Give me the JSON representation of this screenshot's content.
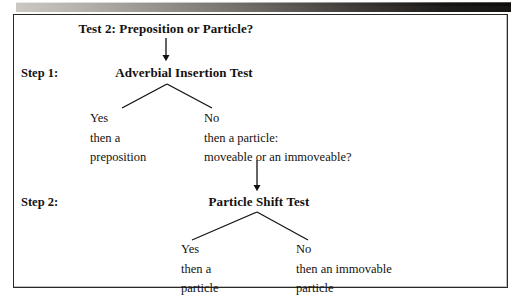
{
  "figure": {
    "title": "Test 2: Preposition or Particle?",
    "steps": [
      {
        "label": "Step 1:",
        "node": "Adverbial Insertion Test",
        "branches": [
          {
            "answer": "Yes",
            "line2": "then a",
            "line3": "preposition"
          },
          {
            "answer": "No",
            "line2": "then a particle:",
            "line3": "moveable or an immoveable?"
          }
        ]
      },
      {
        "label": "Step 2:",
        "node": "Particle Shift Test",
        "branches": [
          {
            "answer": "Yes",
            "line2": "then a",
            "line3": "particle"
          },
          {
            "answer": "No",
            "line2": "then an immovable",
            "line3": "particle"
          }
        ]
      }
    ],
    "colors": {
      "ink": "#14120f",
      "border": "#2b2926",
      "page": "#ffffff"
    }
  }
}
